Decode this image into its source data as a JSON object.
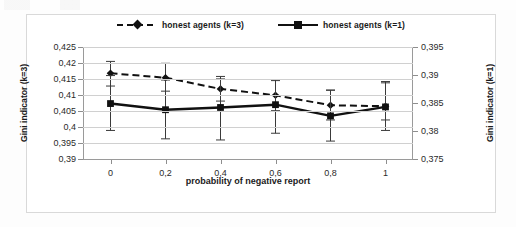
{
  "chart_data": {
    "type": "line",
    "title": "",
    "xlabel": "probability of negative report",
    "ylabel": "Gini indicator (k=3)",
    "ylabel_secondary": "Gini indicator (k=1)",
    "grid": true,
    "legend_position": "top-center",
    "x": [
      0,
      0.2,
      0.4,
      0.6,
      0.8,
      1
    ],
    "xtick_labels": [
      "0",
      "0,2",
      "0,4",
      "0,6",
      "0,8",
      "1"
    ],
    "xlim": [
      -0.1,
      1.1
    ],
    "ylim": [
      0.39,
      0.425
    ],
    "ytick_labels": [
      "0,425",
      "0,42",
      "0,415",
      "0,41",
      "0,405",
      "0,4",
      "0,395",
      "0,39"
    ],
    "ytick_values": [
      0.425,
      0.42,
      0.415,
      0.41,
      0.405,
      0.4,
      0.395,
      0.39
    ],
    "ylim_secondary": [
      0.375,
      0.395
    ],
    "ytick_labels_secondary": [
      "0,395",
      "0,39",
      "0,385",
      "0,38",
      "0,375"
    ],
    "ytick_values_secondary": [
      0.395,
      0.39,
      0.385,
      0.38,
      0.375
    ],
    "series": [
      {
        "name": "honest agents (k=3)",
        "axis": "left",
        "style": "dashed",
        "marker": "diamond",
        "color": "#111111",
        "values": [
          0.4168,
          0.4154,
          0.4119,
          0.4099,
          0.4068,
          0.4065
        ],
        "error_upper": [
          0.4205,
          0.4199,
          0.4158,
          0.4148,
          0.4115,
          0.4142
        ],
        "error_lower": [
          0.4128,
          0.4112,
          0.4081,
          0.4051,
          0.4022,
          0.4022
        ]
      },
      {
        "name": "honest agents (k=1)",
        "axis": "right",
        "style": "solid",
        "marker": "square",
        "color": "#111111",
        "values": [
          0.3849,
          0.3838,
          0.3842,
          0.3847,
          0.3827,
          0.3843
        ],
        "error_upper": [
          0.3899,
          0.3891,
          0.3893,
          0.389,
          0.3873,
          0.3886
        ],
        "error_lower": [
          0.3801,
          0.3786,
          0.3784,
          0.3796,
          0.3782,
          0.3801
        ]
      }
    ]
  },
  "legend": {
    "items": [
      {
        "label": "honest agents (k=3)"
      },
      {
        "label": "honest agents (k=1)"
      }
    ]
  }
}
